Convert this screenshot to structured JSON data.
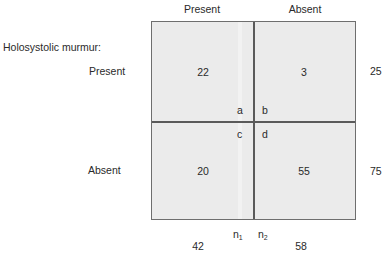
{
  "title": "Holosystolic murmur:",
  "column_headers": [
    "Present",
    "Absent"
  ],
  "row_headers": [
    "Present",
    "Absent"
  ],
  "cells": {
    "a": {
      "label": "a",
      "value": "22"
    },
    "b": {
      "label": "b",
      "value": "3"
    },
    "c": {
      "label": "c",
      "value": "20"
    },
    "d": {
      "label": "d",
      "value": "55"
    }
  },
  "row_totals": [
    "25",
    "75"
  ],
  "column_totals": [
    "42",
    "58"
  ],
  "column_total_labels": [
    {
      "base": "n",
      "sub": "1"
    },
    {
      "base": "n",
      "sub": "2"
    }
  ],
  "colors": {
    "cell_fill": "#ebebeb",
    "lines": "#5a5a5a",
    "text": "#2a2a2a"
  }
}
